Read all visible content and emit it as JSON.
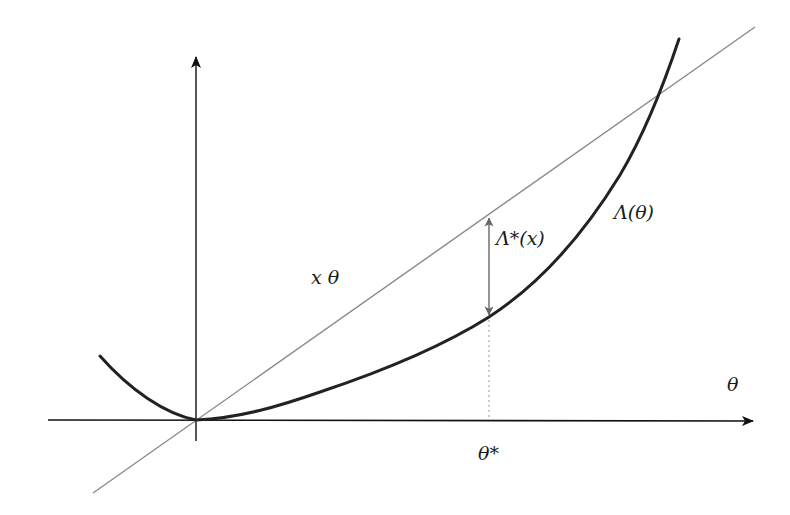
{
  "diagram": {
    "axes": {
      "x_label": "θ",
      "y_label": ""
    },
    "labels": {
      "line": "x θ",
      "curve": "Λ(θ)",
      "gap": "Λ*(x)",
      "optimum": "θ*"
    },
    "elements": [
      {
        "id": "x-axis",
        "type": "arrow",
        "from": [
          48,
          420
        ],
        "to": [
          755,
          421
        ]
      },
      {
        "id": "y-axis",
        "type": "arrow",
        "from": [
          196,
          441
        ],
        "to": [
          196,
          55
        ]
      },
      {
        "id": "line-x-theta",
        "type": "line",
        "from": [
          93,
          493
        ],
        "to": [
          755,
          27
        ],
        "color": "#8a8a8a"
      },
      {
        "id": "curve-lambda",
        "type": "curve",
        "color": "#222222",
        "points": [
          [
            100,
            356
          ],
          [
            196,
            420
          ],
          [
            300,
            397
          ],
          [
            400,
            363
          ],
          [
            489,
            317
          ],
          [
            580,
            230
          ],
          [
            620,
            175
          ],
          [
            660,
            92
          ],
          [
            679,
            39
          ]
        ]
      },
      {
        "id": "gap-arrow",
        "type": "double-arrow",
        "x": 489,
        "from_y": 216,
        "to_y": 317,
        "color": "#666666"
      },
      {
        "id": "theta-star-guide",
        "type": "dotted-line",
        "x": 489,
        "from_y": 320,
        "to_y": 420
      }
    ],
    "colors": {
      "axis": "#111111",
      "curve": "#222222",
      "line": "#8a8a8a",
      "gap_arrow": "#666666",
      "guide": "#999999"
    }
  }
}
